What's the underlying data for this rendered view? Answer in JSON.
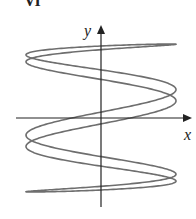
{
  "figure": {
    "label": "VI",
    "x_axis_label": "x",
    "y_axis_label": "y",
    "curve_color": "#6e6e6e",
    "axis_color": "#222222"
  },
  "chart_data": {
    "type": "line",
    "title": "VI",
    "xlabel": "x",
    "ylabel": "y",
    "parametric": {
      "x": "sin(5t + 0.4)",
      "y": "sin(t)",
      "t_range": [
        0,
        6.2832
      ]
    },
    "xlim": [
      -1,
      1
    ],
    "ylim": [
      -1,
      1
    ],
    "grid": false,
    "legend": "none",
    "geometry": {
      "origin_px": [
        101,
        118
      ],
      "x_scale_px": 75,
      "y_scale_px": 74,
      "x_axis_px": [
        20,
        192
      ],
      "y_axis_px": [
        207,
        25
      ]
    }
  }
}
